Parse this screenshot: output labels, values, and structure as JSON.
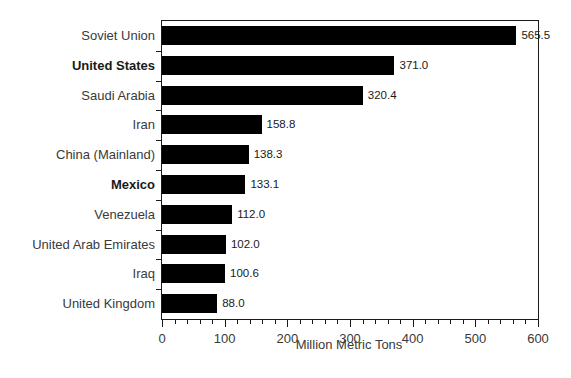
{
  "chart_data": {
    "type": "bar",
    "orientation": "horizontal",
    "title": "",
    "subtitle": "",
    "xlabel": "Million Metric Tons",
    "ylabel": "",
    "xlim": [
      0,
      600
    ],
    "xticks": [
      0,
      100,
      200,
      300,
      400,
      500,
      600
    ],
    "xtick_labels": [
      "0",
      "100",
      "200",
      "300",
      "400",
      "500",
      "600"
    ],
    "minor_tick_step": 20,
    "grid": false,
    "legend": null,
    "bar_color": "#000000",
    "frame_color": "#1a1a1a",
    "categories": [
      "Soviet Union",
      "United States",
      "Saudi Arabia",
      "Iran",
      "China (Mainland)",
      "Mexico",
      "Venezuela",
      "United Arab Emirates",
      "Iraq",
      "United Kingdom"
    ],
    "values": [
      565.5,
      371.0,
      320.4,
      158.8,
      138.3,
      133.1,
      112.0,
      102.0,
      100.6,
      88.0
    ],
    "value_labels": [
      "565.5",
      "371.0",
      "320.4",
      "158.8",
      "138.3",
      "133.1",
      "112.0",
      "102.0",
      "100.6",
      "88.0"
    ],
    "emphasized_categories": [
      "United States",
      "Mexico"
    ],
    "bars": [
      {
        "category": "Soviet Union",
        "value": 565.5,
        "label": "565.5",
        "bold": false
      },
      {
        "category": "United States",
        "value": 371.0,
        "label": "371.0",
        "bold": true
      },
      {
        "category": "Saudi Arabia",
        "value": 320.4,
        "label": "320.4",
        "bold": false
      },
      {
        "category": "Iran",
        "value": 158.8,
        "label": "158.8",
        "bold": false
      },
      {
        "category": "China (Mainland)",
        "value": 138.3,
        "label": "138.3",
        "bold": false
      },
      {
        "category": "Mexico",
        "value": 133.1,
        "label": "133.1",
        "bold": true
      },
      {
        "category": "Venezuela",
        "value": 112.0,
        "label": "112.0",
        "bold": false
      },
      {
        "category": "United Arab Emirates",
        "value": 102.0,
        "label": "102.0",
        "bold": false
      },
      {
        "category": "Iraq",
        "value": 100.6,
        "label": "100.6",
        "bold": false
      },
      {
        "category": "United Kingdom",
        "value": 88.0,
        "label": "88.0",
        "bold": false
      }
    ]
  }
}
